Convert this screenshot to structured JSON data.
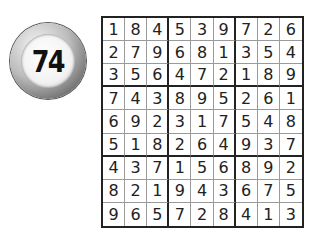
{
  "puzzle": {
    "number": "74",
    "type": "sudoku-solution"
  },
  "grid": [
    [
      "1",
      "8",
      "4",
      "5",
      "3",
      "9",
      "7",
      "2",
      "6"
    ],
    [
      "2",
      "7",
      "9",
      "6",
      "8",
      "1",
      "3",
      "5",
      "4"
    ],
    [
      "3",
      "5",
      "6",
      "4",
      "7",
      "2",
      "1",
      "8",
      "9"
    ],
    [
      "7",
      "4",
      "3",
      "8",
      "9",
      "5",
      "2",
      "6",
      "1"
    ],
    [
      "6",
      "9",
      "2",
      "3",
      "1",
      "7",
      "5",
      "4",
      "8"
    ],
    [
      "5",
      "1",
      "8",
      "2",
      "6",
      "4",
      "9",
      "3",
      "7"
    ],
    [
      "4",
      "3",
      "7",
      "1",
      "5",
      "6",
      "8",
      "9",
      "2"
    ],
    [
      "8",
      "2",
      "1",
      "9",
      "4",
      "3",
      "6",
      "7",
      "5"
    ],
    [
      "9",
      "6",
      "5",
      "7",
      "2",
      "8",
      "4",
      "1",
      "3"
    ]
  ]
}
